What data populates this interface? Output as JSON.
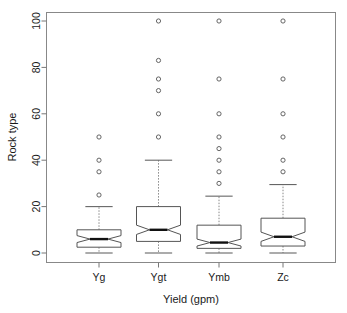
{
  "chart_data": {
    "type": "box",
    "title": "",
    "xlabel": "Yield (gpm)",
    "ylabel": "Rock type",
    "categories": [
      "Yg",
      "Ygt",
      "Ymb",
      "Zc"
    ],
    "ylim": [
      0,
      100
    ],
    "yticks": [
      0,
      20,
      40,
      60,
      80,
      100
    ],
    "ytick_labels": [
      "0",
      "20",
      "40",
      "60",
      "80",
      "100"
    ],
    "grid": false,
    "legend": "none",
    "notched": true,
    "boxes": [
      {
        "name": "Yg",
        "whisker_low": 0,
        "q1": 2.5,
        "median": 6,
        "q3": 10,
        "whisker_high": 20,
        "notch_low": 4.5,
        "notch_high": 7.5,
        "outliers": [
          25,
          35,
          40,
          50
        ]
      },
      {
        "name": "Ygt",
        "whisker_low": 0,
        "q1": 5,
        "median": 10,
        "q3": 20,
        "whisker_high": 40,
        "notch_low": 8,
        "notch_high": 12,
        "outliers": [
          50,
          60,
          70,
          75,
          83,
          100
        ]
      },
      {
        "name": "Ymb",
        "whisker_low": 0,
        "q1": 2,
        "median": 4.5,
        "q3": 12,
        "whisker_high": 24.5,
        "notch_low": 3,
        "notch_high": 6,
        "outliers": [
          30,
          35,
          40,
          45,
          50,
          60,
          75,
          100
        ]
      },
      {
        "name": "Zc",
        "whisker_low": 0,
        "q1": 3,
        "median": 7,
        "q3": 15,
        "whisker_high": 29.5,
        "notch_low": 5,
        "notch_high": 9,
        "outliers": [
          35,
          40,
          50,
          60,
          75,
          100
        ]
      }
    ],
    "colors": {
      "frame": "#888888",
      "box_stroke": "#555555",
      "median": "#111111",
      "whisker": "#888888",
      "outlier": "#555555",
      "text": "#1a1a1a",
      "background": "#ffffff"
    }
  }
}
